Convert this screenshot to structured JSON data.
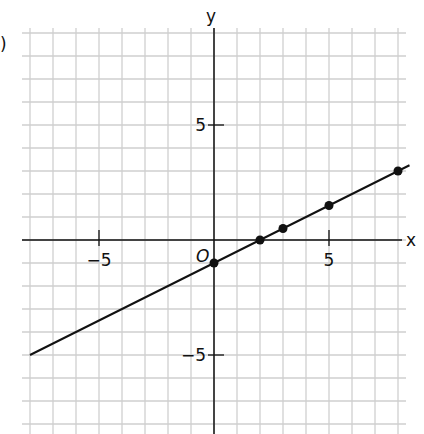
{
  "problem_label": ")",
  "chart_data": {
    "type": "line",
    "title": "",
    "xlabel": "x",
    "ylabel": "y",
    "origin_label": "O",
    "xlim": [
      -8,
      8
    ],
    "ylim": [
      -8,
      9
    ],
    "grid": true,
    "x_ticks": [
      {
        "value": -5,
        "label": "-5"
      },
      {
        "value": 5,
        "label": "5"
      }
    ],
    "y_ticks": [
      {
        "value": 5,
        "label": "5"
      },
      {
        "value": -5,
        "label": "-5"
      }
    ],
    "series": [
      {
        "name": "line",
        "equation": "y = 0.5x - 1",
        "color": "#111111",
        "x": [
          -8,
          8.5
        ],
        "y": [
          -5,
          3.25
        ]
      }
    ],
    "points": [
      {
        "x": 0,
        "y": -1
      },
      {
        "x": 2,
        "y": 0
      },
      {
        "x": 3,
        "y": 0.5
      },
      {
        "x": 5,
        "y": 1.5
      },
      {
        "x": 8,
        "y": 3
      }
    ]
  },
  "colors": {
    "grid": "#cfcfcf",
    "axis": "#111111",
    "line": "#111111"
  }
}
